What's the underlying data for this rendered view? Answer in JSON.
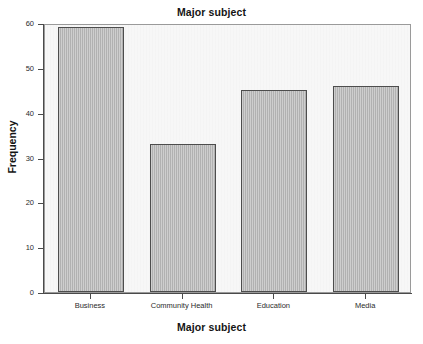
{
  "chart_data": {
    "type": "bar",
    "title": "Major subject",
    "xlabel": "Major subject",
    "ylabel": "Frequency",
    "categories": [
      "Business",
      "Community Health",
      "Education",
      "Media"
    ],
    "values": [
      59,
      33,
      45,
      46
    ],
    "ylim": [
      0,
      60
    ],
    "ytick_labels": [
      "0",
      "10",
      "20",
      "30",
      "40",
      "50",
      "60"
    ],
    "ytick_values": [
      0,
      10,
      20,
      30,
      40,
      50,
      60
    ],
    "grid": false,
    "legend": "none",
    "bar_fill_color": "#b9b9b9",
    "bar_border_color": "#4d4d4d",
    "plot_background_color": "#f7f7f7",
    "figure_background_color": "#ffffff",
    "axis_color": "#4a4a4a"
  }
}
